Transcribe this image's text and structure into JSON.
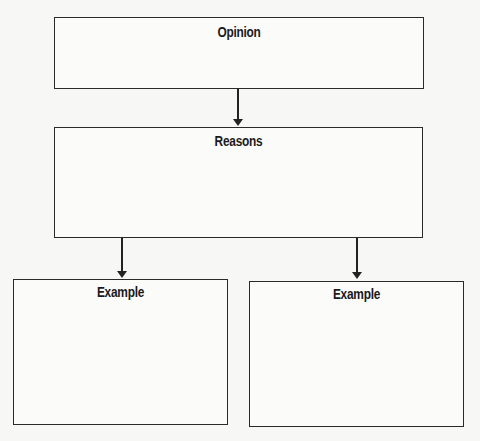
{
  "diagram": {
    "type": "flowchart",
    "nodes": [
      {
        "id": "opinion",
        "label": "Opinion"
      },
      {
        "id": "reasons",
        "label": "Reasons"
      },
      {
        "id": "example_left",
        "label": "Example"
      },
      {
        "id": "example_right",
        "label": "Example"
      }
    ],
    "edges": [
      {
        "from": "opinion",
        "to": "reasons"
      },
      {
        "from": "reasons",
        "to": "example_left"
      },
      {
        "from": "reasons",
        "to": "example_right"
      }
    ],
    "colors": {
      "stroke": "#2a2a2a",
      "background": "#f7f7f5"
    }
  }
}
